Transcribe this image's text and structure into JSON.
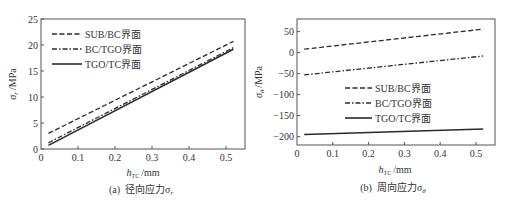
{
  "chart_data": [
    {
      "type": "line",
      "panel": "a",
      "caption": "(a)  径向应力σr",
      "caption_prefix": "(a)",
      "caption_text": "径向应力σ",
      "caption_sub": "r",
      "xlabel": "h",
      "xlabel_sub": "TC",
      "xlabel_unit": "/mm",
      "ylabel": "σ",
      "ylabel_sub": "r",
      "ylabel_unit": "/MPa",
      "xlim": [
        0,
        0.55
      ],
      "ylim": [
        0,
        25
      ],
      "xticks": [
        0,
        0.1,
        0.2,
        0.3,
        0.4,
        0.5
      ],
      "xtick_labels": [
        "0",
        "0.1",
        "0.2",
        "0.3",
        "0.4",
        "0.5"
      ],
      "yticks": [
        0,
        5,
        10,
        15,
        20,
        25
      ],
      "ytick_labels": [
        "0",
        "5",
        "10",
        "15",
        "20",
        "25"
      ],
      "grid": false,
      "legend_position": "upper left",
      "series": [
        {
          "name": "SUB/BC界面",
          "style": "dashed",
          "x": [
            0.02,
            0.52
          ],
          "values": [
            3.0,
            20.7
          ]
        },
        {
          "name": "BC/TGO界面",
          "style": "dashdot",
          "x": [
            0.02,
            0.52
          ],
          "values": [
            1.2,
            19.5
          ]
        },
        {
          "name": "TGO/TC界面",
          "style": "solid",
          "x": [
            0.02,
            0.52
          ],
          "values": [
            0.7,
            19.2
          ]
        }
      ]
    },
    {
      "type": "line",
      "panel": "b",
      "caption": "(b)  周向应力σθ",
      "caption_prefix": "(b)",
      "caption_text": "周向应力σ",
      "caption_sub": "θ",
      "xlabel": "h",
      "xlabel_sub": "TC",
      "xlabel_unit": "/mm",
      "ylabel": "σ",
      "ylabel_sub": "θ",
      "ylabel_unit": "/MPa",
      "xlim": [
        0,
        0.55
      ],
      "ylim": [
        -220,
        80
      ],
      "xticks": [
        0,
        0.1,
        0.2,
        0.3,
        0.4,
        0.5
      ],
      "xtick_labels": [
        "0",
        "0.1",
        "0.2",
        "0.3",
        "0.4",
        "0.5"
      ],
      "yticks": [
        -200,
        -150,
        -100,
        -50,
        0,
        50
      ],
      "ytick_labels": [
        "−200",
        "−150",
        "−100",
        "−50",
        "0",
        "50"
      ],
      "grid": false,
      "legend_position": "center",
      "series": [
        {
          "name": "SUB/BC界面",
          "style": "dashed",
          "x": [
            0.02,
            0.52
          ],
          "values": [
            8,
            56
          ]
        },
        {
          "name": "BC/TGO界面",
          "style": "dashdot",
          "x": [
            0.02,
            0.52
          ],
          "values": [
            -53,
            -8
          ]
        },
        {
          "name": "TGO/TC界面",
          "style": "solid",
          "x": [
            0.02,
            0.52
          ],
          "values": [
            -195,
            -182
          ]
        }
      ]
    }
  ],
  "colors": {
    "line": "#2b2b2b",
    "frame": "#555555",
    "text": "#333333"
  }
}
